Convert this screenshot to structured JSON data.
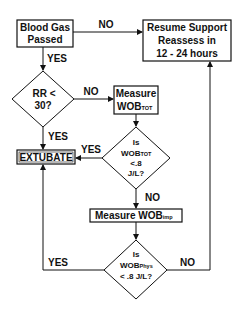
{
  "flowchart": {
    "nodes": {
      "blood_gas": {
        "line1": "Blood Gas",
        "line2": "Passed"
      },
      "resume": {
        "line1": "Resume Support",
        "line2": "Reassess in",
        "line3": "12 - 24 hours"
      },
      "rr": {
        "line1": "RR <",
        "line2": "30?"
      },
      "measure_wob_tot": {
        "line1": "Measure",
        "line2_main": "WOB",
        "line2_sub": "TOT"
      },
      "wob_tot_check": {
        "line1": "Is",
        "line2_main": "WOB",
        "line2_sub": "TOT",
        "line3": "<.8",
        "line4": "J/L?"
      },
      "extubate": {
        "label": "EXTUBATE"
      },
      "measure_wob_imp": {
        "main": "Measure WOB",
        "sub": "imp"
      },
      "wob_phys_check": {
        "line1": "Is",
        "line2_main": "WOB",
        "line2_sub": "Phys",
        "line3": "< .8 J/L?"
      }
    },
    "edge_labels": {
      "blood_gas_no": "NO",
      "blood_gas_yes": "YES",
      "rr_no": "NO",
      "rr_yes": "YES",
      "wob_tot_yes": "YES",
      "wob_tot_no": "NO",
      "wob_phys_yes": "YES",
      "wob_phys_no": "NO"
    },
    "colors": {
      "stroke": "#111111",
      "background": "#ffffff"
    }
  }
}
